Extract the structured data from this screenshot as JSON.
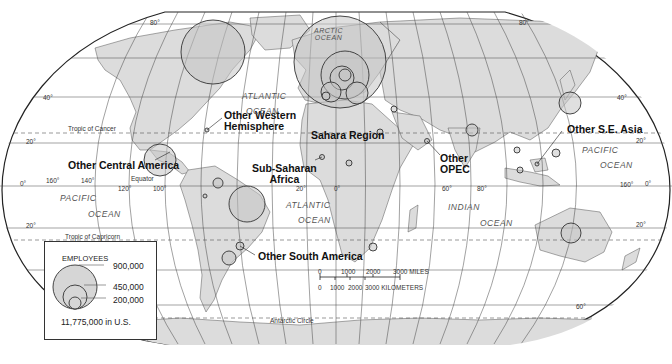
{
  "map": {
    "title": "",
    "projection": "Robinson-style world map",
    "colors": {
      "land": "#dcdcdc",
      "ocean": "#ffffff",
      "circle_fill": "#c8c8c8",
      "lines": "#333333"
    },
    "regions": [
      {
        "label": "Other Western Hemisphere",
        "lines": [
          "Other Western",
          "Hemisphere"
        ]
      },
      {
        "label": "Other Central America"
      },
      {
        "label": "Sahara Region"
      },
      {
        "label": "Sub-Saharan Africa",
        "lines": [
          "Sub-Saharan",
          "Africa"
        ]
      },
      {
        "label": "Other OPEC",
        "lines": [
          "Other",
          "OPEC"
        ]
      },
      {
        "label": "Other S.E. Asia"
      },
      {
        "label": "Other South America"
      }
    ],
    "oceans": {
      "arctic": [
        "ARCTIC",
        "OCEAN"
      ],
      "atlantic_north": [
        "ATLANTIC",
        "OCEAN"
      ],
      "atlantic_south": [
        "ATLANTIC",
        "OCEAN"
      ],
      "pacific_east": [
        "PACIFIC",
        "OCEAN"
      ],
      "pacific_west": [
        "PACIFIC",
        "OCEAN"
      ],
      "indian": [
        "INDIAN",
        "OCEAN"
      ]
    },
    "lines": {
      "tropic_cancer": "Tropic of Cancer",
      "tropic_capricorn": "Tropic of Capricorn",
      "equator": "Equator",
      "antarctic_circle": "Antarctic Circle"
    },
    "degree_labels": {
      "lat_80": "80°",
      "lat_40_left": "40°",
      "lat_40_right": "40°",
      "lat_20_left": "20°",
      "lat_20_right": "20°",
      "lat_0_left": "0°",
      "lat_0_right": "0°",
      "lat_m20_left": "20°",
      "lat_m20_right": "20°",
      "lat_m60": "60°",
      "lon_160w": "160°",
      "lon_140w": "140°",
      "lon_120w": "120°",
      "lon_100w": "100°",
      "lon_20w": "20°",
      "lon_0": "0°",
      "lon_60e": "60°",
      "lon_80e": "80°",
      "lon_160e": "160°"
    },
    "legend": {
      "title": "EMPLOYEES",
      "values": [
        "900,000",
        "450,000",
        "200,000"
      ],
      "us_note": "11,775,000 in U.S."
    },
    "scale": {
      "miles_ticks": [
        "0",
        "1000",
        "2000",
        "3000 MILES"
      ],
      "km_ticks": [
        "0",
        "1000",
        "2000",
        "3000 KILOMETERS"
      ]
    }
  }
}
